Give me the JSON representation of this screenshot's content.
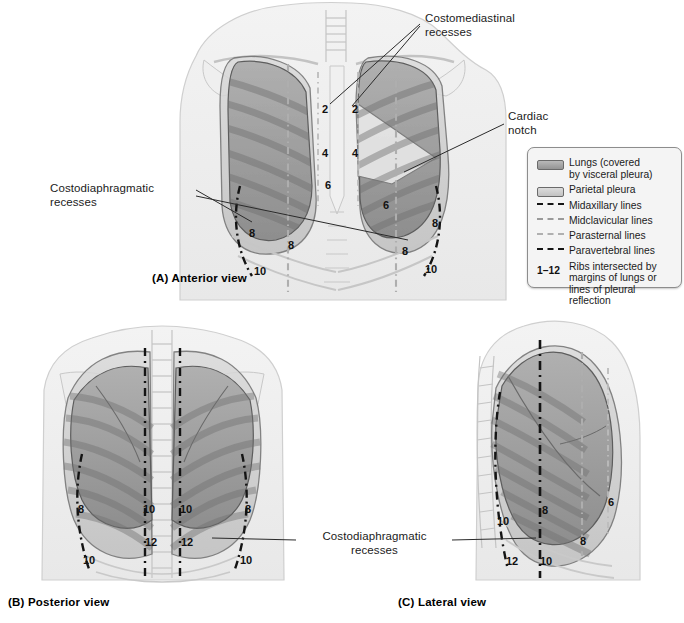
{
  "figure": {
    "panels": [
      {
        "id": "A",
        "caption": "(A) Anterior view"
      },
      {
        "id": "B",
        "caption": "(B) Posterior view"
      },
      {
        "id": "C",
        "caption": "(C) Lateral view"
      }
    ]
  },
  "annotations": {
    "costomediastinal": "Costomediastinal\nrecesses",
    "cardiac_notch": "Cardiac\nnotch",
    "costodiaphragmatic_anterior": "Costodiaphragmatic\nrecesses",
    "costodiaphragmatic_lower": "Costodiaphragmatic\nrecesses"
  },
  "legend": {
    "items": [
      {
        "key": "swatch-lung",
        "label": "Lungs (covered\nby visceral pleura)"
      },
      {
        "key": "swatch-pleura",
        "label": "Parietal pleura"
      },
      {
        "key": "line-midaxillary",
        "label": "Midaxillary lines"
      },
      {
        "key": "line-midclavicular",
        "label": "Midclavicular lines"
      },
      {
        "key": "line-parasternal",
        "label": "Parasternal lines"
      },
      {
        "key": "line-paravertebral",
        "label": "Paravertebral lines"
      }
    ],
    "rib_range": "1–12",
    "rib_note": "Ribs intersected by\nmargins of lungs or\nlines of pleural\nreflection"
  },
  "rib_numbers": {
    "anterior": [
      {
        "value": "2",
        "x": 322,
        "y": 104
      },
      {
        "value": "2",
        "x": 352,
        "y": 104
      },
      {
        "value": "4",
        "x": 322,
        "y": 148
      },
      {
        "value": "4",
        "x": 352,
        "y": 148
      },
      {
        "value": "6",
        "x": 325,
        "y": 180
      },
      {
        "value": "6",
        "x": 383,
        "y": 200
      },
      {
        "value": "8",
        "x": 249,
        "y": 228
      },
      {
        "value": "8",
        "x": 288,
        "y": 240
      },
      {
        "value": "8",
        "x": 402,
        "y": 246
      },
      {
        "value": "8",
        "x": 432,
        "y": 218
      },
      {
        "value": "10",
        "x": 254,
        "y": 266
      },
      {
        "value": "10",
        "x": 425,
        "y": 264
      }
    ],
    "posterior": [
      {
        "value": "8",
        "x": 78,
        "y": 504
      },
      {
        "value": "10",
        "x": 143,
        "y": 504
      },
      {
        "value": "10",
        "x": 180,
        "y": 504
      },
      {
        "value": "8",
        "x": 245,
        "y": 504
      },
      {
        "value": "12",
        "x": 145,
        "y": 537
      },
      {
        "value": "12",
        "x": 181,
        "y": 537
      },
      {
        "value": "10",
        "x": 83,
        "y": 555
      },
      {
        "value": "10",
        "x": 240,
        "y": 555
      }
    ],
    "lateral": [
      {
        "value": "6",
        "x": 608,
        "y": 497
      },
      {
        "value": "8",
        "x": 542,
        "y": 505
      },
      {
        "value": "8",
        "x": 580,
        "y": 536
      },
      {
        "value": "10",
        "x": 497,
        "y": 516
      },
      {
        "value": "10",
        "x": 540,
        "y": 556
      },
      {
        "value": "12",
        "x": 506,
        "y": 556
      }
    ]
  },
  "colors": {
    "lung_fill": "#9b9b9b",
    "pleura_fill": "#cfcfcf",
    "body_outline": "#c9c9c9",
    "skeleton": "#bdbdbd",
    "dark_line": "#151515",
    "light_line": "#a8a8a8",
    "legend_bg": "#f4f4f4",
    "legend_border": "#8d8d8d",
    "text": "#1b1b1b"
  }
}
